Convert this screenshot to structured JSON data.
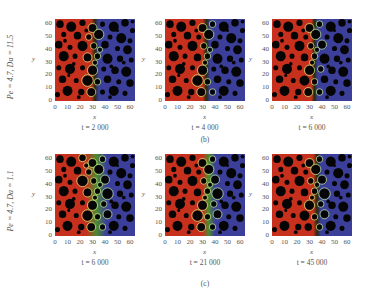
{
  "figure": {
    "rows": [
      {
        "row_label": "Pe = 4.7, Da = 11.5",
        "subfigure_label": "(b)",
        "panels": [
          {
            "time_label": "t = 2 000",
            "front_x": 32,
            "front_width": 6,
            "style": "sharp"
          },
          {
            "time_label": "t = 4 000",
            "front_x": 33,
            "front_width": 6,
            "style": "sharp"
          },
          {
            "time_label": "t = 6 000",
            "front_x": 34,
            "front_width": 5,
            "style": "sharp"
          }
        ]
      },
      {
        "row_label": "Pe = 4.7, Da = 1.1",
        "subfigure_label": "(c)",
        "panels": [
          {
            "time_label": "t = 6 000",
            "front_x": 33,
            "front_width": 16,
            "style": "diffuse"
          },
          {
            "time_label": "t = 21 000",
            "front_x": 35,
            "front_width": 10,
            "style": "mixed"
          },
          {
            "time_label": "t = 45 000",
            "front_x": 36,
            "front_width": 6,
            "style": "sharp"
          }
        ]
      }
    ],
    "axes": {
      "xlabel": "x",
      "ylabel": "y",
      "xticks": [
        "0",
        "10",
        "20",
        "30",
        "40",
        "50",
        "60"
      ],
      "yticks": [
        "0",
        "10",
        "20",
        "30",
        "40",
        "50",
        "60"
      ],
      "range": [
        0,
        64
      ]
    },
    "colors": {
      "left_fluid": "#c8301e",
      "right_fluid": "#3b3f9a",
      "reaction_front": "#4e8a2e",
      "front_ring": "#b6e07a",
      "obstacle": "#050505"
    },
    "obstacles": [
      [
        4,
        60,
        3
      ],
      [
        13,
        58,
        4
      ],
      [
        22,
        61,
        2.5
      ],
      [
        30,
        57,
        3
      ],
      [
        38,
        60,
        2
      ],
      [
        47,
        58,
        4
      ],
      [
        56,
        61,
        3
      ],
      [
        62,
        55,
        2
      ],
      [
        7,
        52,
        2
      ],
      [
        18,
        51,
        3
      ],
      [
        27,
        50,
        2
      ],
      [
        35,
        52,
        3.5
      ],
      [
        44,
        50,
        2
      ],
      [
        53,
        49,
        4
      ],
      [
        60,
        47,
        2
      ],
      [
        3,
        44,
        3
      ],
      [
        12,
        42,
        2
      ],
      [
        22,
        43,
        4
      ],
      [
        31,
        43,
        2
      ],
      [
        40,
        44,
        3
      ],
      [
        50,
        41,
        2
      ],
      [
        58,
        40,
        3.5
      ],
      [
        7,
        35,
        4
      ],
      [
        16,
        35,
        2
      ],
      [
        26,
        34,
        3
      ],
      [
        34,
        35,
        2
      ],
      [
        42,
        33,
        4
      ],
      [
        52,
        33,
        2.5
      ],
      [
        61,
        32,
        2
      ],
      [
        3,
        26,
        2
      ],
      [
        12,
        25,
        4
      ],
      [
        22,
        26,
        2
      ],
      [
        30,
        24,
        3.5
      ],
      [
        39,
        25,
        2
      ],
      [
        48,
        24,
        3
      ],
      [
        57,
        23,
        4
      ],
      [
        6,
        17,
        3
      ],
      [
        17,
        16,
        2
      ],
      [
        26,
        16,
        4
      ],
      [
        34,
        15,
        2
      ],
      [
        42,
        17,
        3
      ],
      [
        51,
        15,
        2
      ],
      [
        60,
        14,
        3
      ],
      [
        10,
        8,
        4
      ],
      [
        21,
        7,
        2.5
      ],
      [
        29,
        7,
        3
      ],
      [
        38,
        7,
        2
      ],
      [
        47,
        8,
        4
      ],
      [
        56,
        6,
        2
      ],
      [
        2,
        5,
        2
      ],
      [
        15,
        29,
        1.5
      ],
      [
        36,
        40,
        1.5
      ],
      [
        45,
        27,
        1.5
      ],
      [
        25,
        55,
        1.5
      ],
      [
        55,
        30,
        1.5
      ],
      [
        8,
        47,
        1.5
      ],
      [
        19,
        3,
        1.5
      ],
      [
        44,
        3,
        1.5
      ],
      [
        62,
        62,
        1.5
      ],
      [
        32,
        30,
        1.5
      ],
      [
        50,
        55,
        1.2
      ],
      [
        11,
        20,
        1.2
      ]
    ]
  }
}
